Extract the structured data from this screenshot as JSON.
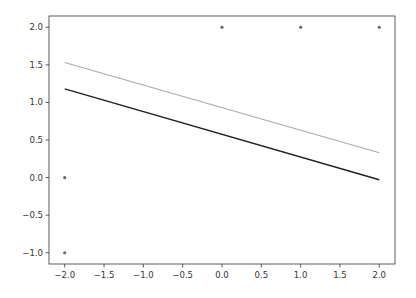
{
  "chart_data": {
    "type": "line",
    "title": "",
    "xlabel": "",
    "ylabel": "",
    "xlim": [
      -2.2,
      2.2
    ],
    "ylim": [
      -1.15,
      2.15
    ],
    "grid": false,
    "legend": null,
    "x_ticks": [
      "-2.0",
      "-1.5",
      "-1.0",
      "-0.5",
      "0.0",
      "0.5",
      "1.0",
      "1.5",
      "2.0"
    ],
    "y_ticks": [
      "2.0",
      "1.5",
      "1.0",
      "0.5",
      "0.0",
      "-0.5",
      "-1.0"
    ],
    "series": [
      {
        "name": "fit-line-grey",
        "kind": "line",
        "color": "#aaaaaa",
        "x": [
          -2.0,
          2.0
        ],
        "y": [
          1.53,
          0.33
        ]
      },
      {
        "name": "fit-line-black",
        "kind": "line",
        "color": "#222222",
        "x": [
          -2.0,
          2.0
        ],
        "y": [
          1.18,
          -0.03
        ]
      },
      {
        "name": "data-points",
        "kind": "scatter",
        "color": "#666666",
        "x": [
          -2.0,
          -2.0,
          0.0,
          1.0,
          2.0
        ],
        "y": [
          0.0,
          -1.0,
          2.0,
          2.0,
          2.0
        ]
      }
    ]
  }
}
